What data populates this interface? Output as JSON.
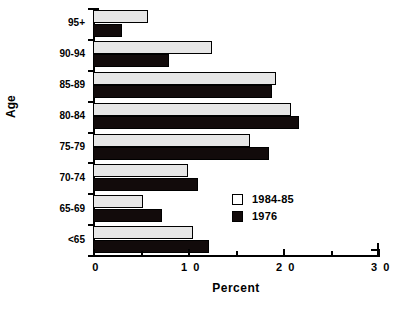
{
  "chart_data": {
    "type": "bar",
    "orientation": "horizontal",
    "title": "",
    "xlabel": "Percent",
    "ylabel": "Age",
    "xlim": [
      0,
      3.0
    ],
    "xticks": [
      "0",
      "1 0",
      "2 0",
      "3 0"
    ],
    "xtick_values": [
      0,
      1.0,
      2.0,
      3.0
    ],
    "minor_xticks": [
      0.5,
      1.5,
      2.5
    ],
    "grid": false,
    "legend_position": "center-right",
    "categories": [
      "95+",
      "90-94",
      "85-89",
      "80-84",
      "75-79",
      "70-74",
      "65-69",
      "<65"
    ],
    "series": [
      {
        "name": "1984-85",
        "color": "#e6e6e6",
        "values": [
          0.58,
          1.25,
          1.93,
          2.08,
          1.65,
          1.0,
          0.53,
          1.05
        ]
      },
      {
        "name": "1976",
        "color": "#120b0b",
        "values": [
          0.3,
          0.8,
          1.88,
          2.17,
          1.85,
          1.1,
          0.73,
          1.22
        ]
      }
    ]
  },
  "legend": {
    "items": [
      {
        "label": "1984-85",
        "style": "light"
      },
      {
        "label": "1976",
        "style": "dark"
      }
    ]
  }
}
